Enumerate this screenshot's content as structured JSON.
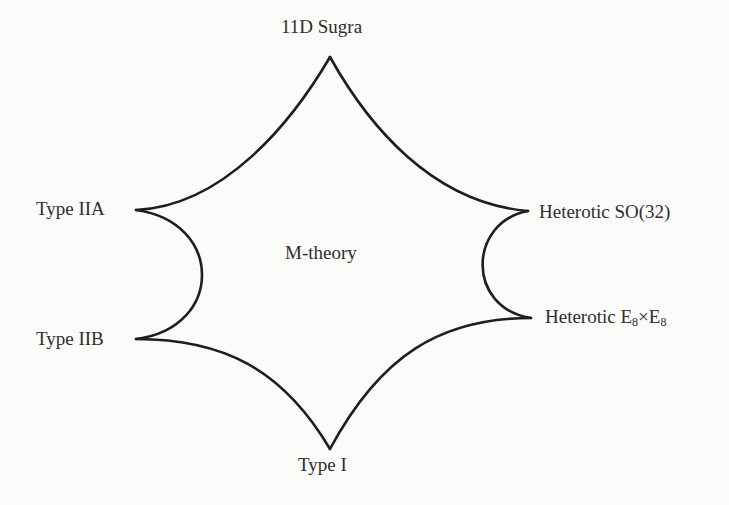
{
  "diagram": {
    "center_label": "M-theory",
    "nodes": [
      {
        "id": "top",
        "label": "11D Sugra",
        "position": "top",
        "cusp": [
          330,
          57
        ]
      },
      {
        "id": "right_top",
        "label": "Heterotic SO(32)",
        "position": "right-top",
        "cusp": [
          528,
          211
        ]
      },
      {
        "id": "right_bottom",
        "label_main": "Heterotic E",
        "label_sub1": "8",
        "label_mid": "×E",
        "label_sub2": "8",
        "label": "Heterotic E8×E8",
        "position": "right-bottom",
        "cusp": [
          531,
          318
        ]
      },
      {
        "id": "bottom",
        "label": "Type I",
        "position": "bottom",
        "cusp": [
          330,
          449
        ]
      },
      {
        "id": "left_bottom",
        "label": "Type IIB",
        "position": "left-bottom",
        "cusp": [
          136,
          339
        ]
      },
      {
        "id": "left_top",
        "label": "Type IIA",
        "position": "left-top",
        "cusp": [
          136,
          210
        ]
      }
    ],
    "edges": [
      {
        "from": "top",
        "to": "right_top"
      },
      {
        "from": "right_top",
        "to": "right_bottom"
      },
      {
        "from": "right_bottom",
        "to": "bottom"
      },
      {
        "from": "bottom",
        "to": "left_bottom"
      },
      {
        "from": "left_bottom",
        "to": "left_top"
      },
      {
        "from": "left_top",
        "to": "top"
      }
    ],
    "colors": {
      "stroke": "#1e1e1e",
      "text": "#2e2e2e",
      "background": "#fbfbfa"
    }
  }
}
